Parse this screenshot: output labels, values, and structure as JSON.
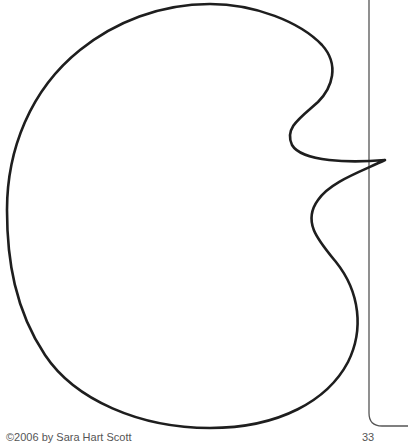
{
  "page": {
    "background": "#ffffff",
    "stroke_color": "#1e1e1e",
    "frame_color": "#555555"
  },
  "illustration": {
    "description": "closed outline of an organic blob shape with a pointed tip touching the page frame",
    "stroke_width": 2.6
  },
  "frame": {
    "line_x": 369,
    "bottom_y": 426
  },
  "footer": {
    "left_text": "©2006 by Sara Hart Scott",
    "right_text": "33"
  }
}
